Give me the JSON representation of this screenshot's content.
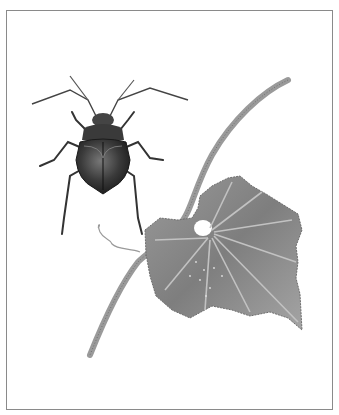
{
  "illustration": {
    "subject": "Beetle and cucurbit leaf on vine",
    "style": "grayscale pencil illustration",
    "elements": [
      "beetle",
      "vine-stem",
      "leaf",
      "tendril"
    ],
    "colors": {
      "background": "#ffffff",
      "frame": "#8a8a8a",
      "beetle_dark": "#2a2a2a",
      "beetle_mid": "#555555",
      "leaf_fill": "#8c8c8c",
      "leaf_vein": "#bdbdbd",
      "stem": "#9a9a9a"
    }
  }
}
